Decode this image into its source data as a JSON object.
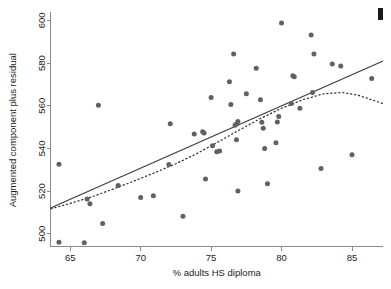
{
  "chart_data": {
    "type": "scatter",
    "title": "",
    "xlabel": "% adults HS diploma",
    "ylabel": "Augmented component plus residual",
    "xlim": [
      63.6,
      87.2
    ],
    "ylim": [
      494,
      603
    ],
    "xticks": [
      65,
      70,
      75,
      80,
      85
    ],
    "yticks": [
      500,
      520,
      540,
      560,
      580,
      600
    ],
    "xtick_labels": [
      "65",
      "70",
      "75",
      "80",
      "85"
    ],
    "ytick_labels": [
      "500",
      "520",
      "540",
      "560",
      "580",
      "600"
    ],
    "grid": false,
    "legend": "none",
    "marker_color": "#5f6169",
    "line_color": "#3a3a3a",
    "points": [
      [
        64.2,
        496.0
      ],
      [
        64.2,
        532.6
      ],
      [
        66.0,
        495.8
      ],
      [
        66.2,
        516.3
      ],
      [
        66.4,
        514.0
      ],
      [
        67.0,
        560.2
      ],
      [
        67.3,
        504.8
      ],
      [
        68.4,
        522.6
      ],
      [
        70.0,
        517.0
      ],
      [
        70.9,
        517.8
      ],
      [
        72.0,
        532.4
      ],
      [
        72.1,
        551.6
      ],
      [
        73.0,
        508.2
      ],
      [
        73.8,
        546.8
      ],
      [
        74.4,
        547.8
      ],
      [
        74.5,
        547.2
      ],
      [
        74.6,
        525.6
      ],
      [
        75.0,
        563.8
      ],
      [
        75.1,
        541.2
      ],
      [
        75.4,
        538.4
      ],
      [
        75.6,
        538.8
      ],
      [
        76.3,
        571.2
      ],
      [
        76.4,
        560.6
      ],
      [
        76.6,
        584.2
      ],
      [
        76.7,
        550.8
      ],
      [
        76.8,
        551.4
      ],
      [
        76.8,
        544.0
      ],
      [
        76.9,
        552.6
      ],
      [
        76.9,
        520.0
      ],
      [
        77.5,
        565.6
      ],
      [
        78.2,
        577.6
      ],
      [
        78.5,
        562.8
      ],
      [
        78.6,
        552.2
      ],
      [
        78.7,
        549.4
      ],
      [
        78.8,
        540.0
      ],
      [
        79.0,
        523.4
      ],
      [
        79.6,
        542.6
      ],
      [
        79.7,
        552.4
      ],
      [
        79.8,
        555.0
      ],
      [
        80.0,
        598.8
      ],
      [
        80.7,
        561.0
      ],
      [
        80.8,
        574.0
      ],
      [
        80.9,
        573.6
      ],
      [
        81.3,
        558.8
      ],
      [
        82.1,
        593.2
      ],
      [
        82.2,
        566.2
      ],
      [
        82.3,
        584.2
      ],
      [
        82.8,
        530.6
      ],
      [
        83.6,
        579.6
      ],
      [
        84.2,
        578.6
      ],
      [
        85.0,
        537.0
      ],
      [
        86.4,
        572.8
      ]
    ],
    "linear_fit": {
      "label": "linear fit",
      "style": "solid",
      "points": [
        [
          63.6,
          512.1
        ],
        [
          87.2,
          581.0
        ]
      ]
    },
    "lowess_fit": {
      "label": "lowess smoother",
      "style": "dashed",
      "points": [
        [
          63.6,
          511.6
        ],
        [
          65.0,
          514.2
        ],
        [
          66.5,
          517.2
        ],
        [
          68.0,
          520.8
        ],
        [
          69.5,
          524.6
        ],
        [
          71.0,
          528.6
        ],
        [
          72.5,
          532.8
        ],
        [
          74.0,
          537.6
        ],
        [
          75.5,
          543.0
        ],
        [
          77.0,
          548.6
        ],
        [
          78.5,
          554.0
        ],
        [
          80.0,
          558.8
        ],
        [
          81.5,
          562.8
        ],
        [
          83.0,
          565.6
        ],
        [
          84.3,
          566.2
        ],
        [
          85.4,
          565.0
        ],
        [
          86.3,
          563.0
        ],
        [
          87.2,
          561.0
        ]
      ]
    }
  },
  "annotations": {
    "corner_mark": ""
  }
}
